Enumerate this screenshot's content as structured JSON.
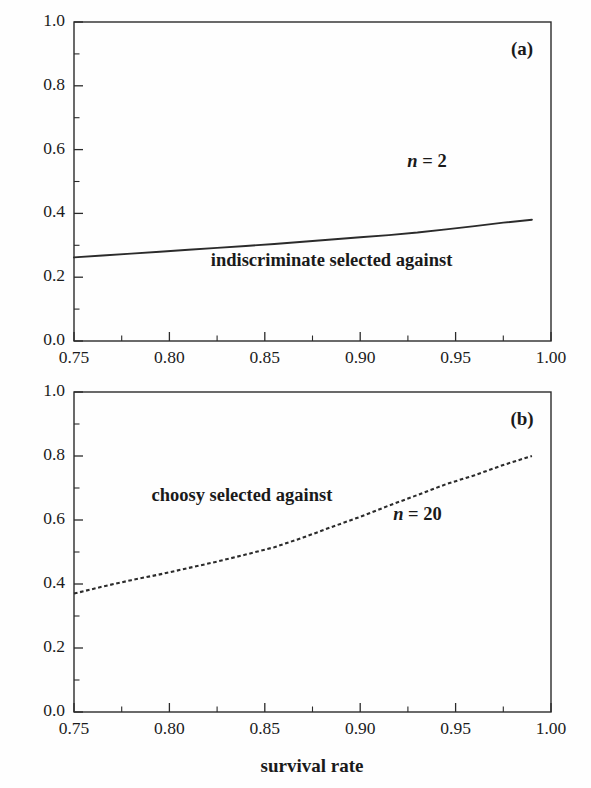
{
  "figure": {
    "background_color": "#ffffff",
    "ink_color": "#2b2b2b"
  },
  "chart_data": [
    {
      "type": "line",
      "panel_tag": "(a)",
      "title": "",
      "xlabel": "",
      "ylabel": "",
      "xlim": [
        0.75,
        1.0
      ],
      "ylim": [
        0.0,
        1.0
      ],
      "grid": false,
      "legend": "none",
      "xticks": [
        0.75,
        0.8,
        0.85,
        0.9,
        0.95,
        1.0
      ],
      "xticklabels": [
        "0.75",
        "0.80",
        "0.85",
        "0.90",
        "0.95",
        "1.00"
      ],
      "xminor_step": 0.025,
      "yticks": [
        0.0,
        0.2,
        0.4,
        0.6,
        0.8,
        1.0
      ],
      "yticklabels": [
        "0.0",
        "0.2",
        "0.4",
        "0.6",
        "0.8",
        "1.0"
      ],
      "yminor_step": 0.1,
      "series": [
        {
          "name": "n = 2 threshold",
          "style": "solid",
          "x": [
            0.75,
            0.765,
            0.78,
            0.795,
            0.81,
            0.825,
            0.84,
            0.855,
            0.87,
            0.885,
            0.9,
            0.915,
            0.93,
            0.945,
            0.96,
            0.975,
            0.99
          ],
          "y": [
            0.262,
            0.268,
            0.274,
            0.28,
            0.286,
            0.292,
            0.298,
            0.304,
            0.311,
            0.318,
            0.325,
            0.332,
            0.34,
            0.35,
            0.36,
            0.371,
            0.38
          ]
        }
      ],
      "annotations": [
        {
          "text": "n = 2",
          "italic_prefix": "n",
          "rest": " = 2",
          "x": 0.935,
          "y": 0.545
        },
        {
          "text": "indiscriminate selected against",
          "x": 0.885,
          "y": 0.235
        }
      ]
    },
    {
      "type": "line",
      "panel_tag": "(b)",
      "title": "",
      "xlabel": "survival rate",
      "ylabel": "",
      "xlim": [
        0.75,
        1.0
      ],
      "ylim": [
        0.0,
        1.0
      ],
      "grid": false,
      "legend": "none",
      "xticks": [
        0.75,
        0.8,
        0.85,
        0.9,
        0.95,
        1.0
      ],
      "xticklabels": [
        "0.75",
        "0.80",
        "0.85",
        "0.90",
        "0.95",
        "1.00"
      ],
      "xminor_step": 0.025,
      "yticks": [
        0.0,
        0.2,
        0.4,
        0.6,
        0.8,
        1.0
      ],
      "yticklabels": [
        "0.0",
        "0.2",
        "0.4",
        "0.6",
        "0.8",
        "1.0"
      ],
      "yminor_step": 0.1,
      "series": [
        {
          "name": "n = 20 threshold",
          "style": "dashed",
          "x": [
            0.75,
            0.765,
            0.78,
            0.795,
            0.81,
            0.825,
            0.84,
            0.855,
            0.87,
            0.885,
            0.9,
            0.915,
            0.93,
            0.945,
            0.96,
            0.975,
            0.99
          ],
          "y": [
            0.37,
            0.392,
            0.412,
            0.43,
            0.45,
            0.47,
            0.492,
            0.515,
            0.545,
            0.578,
            0.61,
            0.645,
            0.678,
            0.712,
            0.74,
            0.772,
            0.8
          ]
        }
      ],
      "annotations": [
        {
          "text": "n = 20",
          "italic_prefix": "n",
          "rest": " = 20",
          "x": 0.93,
          "y": 0.6
        },
        {
          "text": "choosy selected against",
          "x": 0.838,
          "y": 0.66
        }
      ]
    }
  ]
}
